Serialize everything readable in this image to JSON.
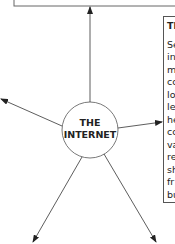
{
  "diagram": {
    "center_node": {
      "line1": "THE",
      "line2": "INTERNET"
    },
    "sidebar": {
      "title": "Th",
      "lines": [
        "Se",
        "in",
        "m",
        "co",
        "lo",
        "le",
        "he",
        "co",
        "va",
        "re",
        "sh",
        "fr",
        "bu",
        "fo"
      ]
    },
    "colors": {
      "stroke": "#444444",
      "text": "#222222",
      "background": "#ffffff"
    }
  }
}
